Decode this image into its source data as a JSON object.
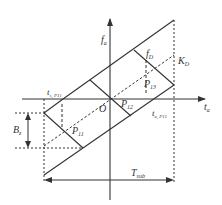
{
  "diagram": {
    "type": "timing-frequency geometry",
    "colors": {
      "line": "#333333",
      "background": "#ffffff"
    },
    "axes": {
      "horizontal": {
        "label": "t",
        "label_sub": "a"
      },
      "vertical": {
        "label": "f",
        "label_sub": "a"
      },
      "origin": "O"
    },
    "labels": {
      "f_D": {
        "main": "f",
        "sub": "D"
      },
      "K_D": {
        "main": "K",
        "sub": "D"
      },
      "P11": {
        "main": "P",
        "sub": "11"
      },
      "P12": {
        "main": "P",
        "sub": "12"
      },
      "P13": {
        "main": "P",
        "sub": "13"
      },
      "t_left": {
        "main": "t",
        "sub": "s, P11"
      },
      "t_right": {
        "main": "t",
        "sub": "e, P11"
      },
      "B_z": {
        "main": "B",
        "sub": "z"
      },
      "T_sub": {
        "main": "T",
        "sub": "sub"
      }
    }
  }
}
